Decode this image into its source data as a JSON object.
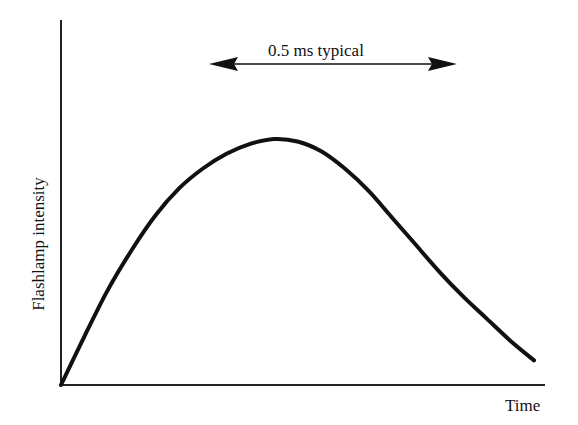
{
  "chart_data": {
    "type": "line",
    "title": "",
    "xlabel": "Time",
    "ylabel": "Flashlamp intensity",
    "grid": false,
    "legend": null,
    "axis_ticks": false,
    "annotations": [
      {
        "text": "0.5 ms typical",
        "type": "double-headed-arrow",
        "description": "Indicates typical flashlamp pulse duration spanning the curve's main width"
      }
    ],
    "series": [
      {
        "name": "Flashlamp intensity",
        "x": [
          0,
          0.05,
          0.1,
          0.15,
          0.2,
          0.25,
          0.3,
          0.35,
          0.4,
          0.45,
          0.5,
          0.55,
          0.6,
          0.65,
          0.7,
          0.75,
          0.8,
          0.85,
          0.9,
          0.95,
          1.0
        ],
        "values": [
          0,
          0.2,
          0.39,
          0.55,
          0.69,
          0.8,
          0.88,
          0.94,
          0.98,
          1.0,
          0.99,
          0.95,
          0.88,
          0.79,
          0.68,
          0.57,
          0.46,
          0.36,
          0.27,
          0.18,
          0.1
        ]
      }
    ],
    "xlim": [
      0,
      1
    ],
    "ylim": [
      0,
      1
    ]
  },
  "labels": {
    "y_axis": "Flashlamp intensity",
    "x_axis": "Time",
    "duration": "0.5 ms typical"
  }
}
